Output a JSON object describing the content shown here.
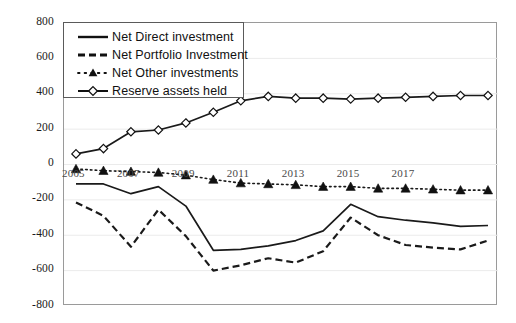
{
  "chart_data": {
    "type": "line",
    "title": "",
    "xlabel": "",
    "ylabel": "",
    "ylim": [
      -800,
      800
    ],
    "ytick_step": 200,
    "yticks": [
      "800",
      "600",
      "400",
      "200",
      "0",
      "-200",
      "-400",
      "-600",
      "-800"
    ],
    "grid": true,
    "legend_position": "top-left inside plot",
    "x": [
      2005,
      2006,
      2007,
      2008,
      2009,
      2010,
      2011,
      2012,
      2013,
      2014,
      2015,
      2016,
      2017,
      2018,
      2019,
      2020
    ],
    "xtick_labels": [
      "2005",
      "2007",
      "2009",
      "2011",
      "2013",
      "2015",
      "2017"
    ],
    "xtick_positions": [
      2005,
      2007,
      2009,
      2011,
      2013,
      2015,
      2017
    ],
    "series": [
      {
        "name": "Net Direct investment",
        "style": "solid",
        "marker": "none",
        "color": "#1a1a1a",
        "values": [
          -110,
          -110,
          -165,
          -125,
          -235,
          -485,
          -480,
          -460,
          -430,
          -375,
          -225,
          -295,
          -315,
          -330,
          -350,
          -345
        ]
      },
      {
        "name": "Net Portfolio Investment",
        "style": "dashed",
        "marker": "none",
        "color": "#1a1a1a",
        "values": [
          -215,
          -290,
          -465,
          -255,
          -405,
          -600,
          -570,
          -530,
          -555,
          -490,
          -300,
          -400,
          -455,
          -470,
          -480,
          -430
        ]
      },
      {
        "name": "Net Other investments",
        "style": "dotted",
        "marker": "triangle",
        "color": "#1a1a1a",
        "values": [
          -25,
          -35,
          -40,
          -45,
          -60,
          -85,
          -105,
          -110,
          -115,
          -125,
          -125,
          -135,
          -135,
          -140,
          -145,
          -145
        ]
      },
      {
        "name": "Reserve assets held",
        "style": "solid",
        "marker": "diamond",
        "color": "#1a1a1a",
        "values": [
          60,
          90,
          185,
          195,
          235,
          295,
          360,
          385,
          375,
          375,
          370,
          375,
          380,
          385,
          390,
          390
        ]
      }
    ]
  },
  "legend": {
    "items": [
      {
        "label": "Net Direct investment",
        "symbol": "solid-line"
      },
      {
        "label": "Net Portfolio Investment",
        "symbol": "dashed-line"
      },
      {
        "label": "Net Other investments",
        "symbol": "dotted-line-triangle"
      },
      {
        "label": "Reserve assets held",
        "symbol": "solid-line-diamond"
      }
    ]
  }
}
